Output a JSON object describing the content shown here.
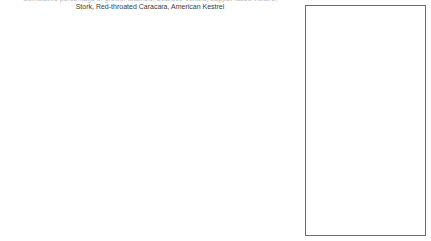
{
  "title": {
    "line1_clipped": "Cumulative percentage of growth attained, Bearded Vulture, Lappet-faced Vulture,",
    "line2": "Stork, Red-throated Caracara, American Kestrel"
  },
  "axes": {
    "y_ticks": [
      "0%",
      "10%",
      "20%",
      "30%",
      "40%",
      "50%",
      "60%",
      "70%",
      "80%",
      "90%",
      "100%"
    ],
    "y_min": 0,
    "y_max": 100,
    "x_ticks": [
      "62.5",
      "65",
      "67.5",
      "70",
      "72.5",
      "75",
      "77.5",
      "80",
      "82.5",
      "85",
      "87.5",
      "90",
      "92.5",
      "95"
    ],
    "x_min": 60,
    "x_max": 96.25,
    "x_label": "",
    "y_label": ""
  },
  "legend": {
    "items": [
      {
        "label": "Gypaetus barbatus",
        "marker": "filled-square"
      },
      {
        "label": "Torgos tracheliotus",
        "marker": "open-square"
      },
      {
        "label": "Sarcogyps calvus",
        "marker": "filled-diamond"
      },
      {
        "label": "Spilornis cheela",
        "marker": "open-diamond"
      },
      {
        "label": "Buteo buteo",
        "marker": "filled-triangle"
      },
      {
        "label": "Vultur gryphus",
        "marker": "open-triangle"
      },
      {
        "label": "Sarcoramphus papa",
        "marker": "cross-x"
      },
      {
        "label": "Mycteria ibis",
        "marker": "asterisk"
      },
      {
        "label": "Sagittarius serpentarius",
        "marker": "short-dash"
      },
      {
        "label": "Leptoptilos crumeniferus",
        "marker": "bold-dash"
      },
      {
        "label": "Daptrius americanus",
        "marker": "filled-square"
      },
      {
        "label": "Falco sparverius",
        "marker": "open-square"
      }
    ]
  },
  "chart_data": {
    "type": "line",
    "title": "Cumulative percentage of growth attained",
    "xlabel": "",
    "ylabel": "",
    "xlim": [
      60,
      96.25
    ],
    "ylim": [
      0,
      100
    ],
    "grid": false,
    "legend_position": "right",
    "x": [
      60,
      62.5,
      65,
      67.5,
      70,
      72.5,
      75,
      77.5,
      80,
      82.5,
      85,
      87.5,
      90,
      92.5,
      95
    ],
    "series": [
      {
        "name": "Torgos tracheliotus",
        "marker": "open-square",
        "values": [
          40,
          47,
          56,
          66,
          76,
          84,
          90,
          95,
          97,
          99,
          100,
          100,
          100,
          100,
          100
        ]
      },
      {
        "name": "Gypaetus barbatus",
        "marker": "filled-square",
        "values": [
          30,
          37,
          45,
          54,
          64,
          73,
          81,
          88,
          93,
          96,
          98,
          100,
          100,
          100,
          100
        ]
      },
      {
        "name": "Leptoptilos crumeniferus",
        "marker": "bold-dash",
        "values": [
          27,
          33,
          41,
          50,
          60,
          70,
          79,
          87,
          92,
          96,
          98,
          100,
          100,
          100,
          100
        ]
      },
      {
        "name": "Sagittarius serpentarius",
        "marker": "short-dash",
        "values": [
          26,
          32,
          39,
          48,
          58,
          68,
          78,
          86,
          92,
          96,
          98,
          100,
          100,
          100,
          100
        ]
      },
      {
        "name": "Sarcoramphus papa",
        "marker": "cross-x",
        "values": [
          24,
          30,
          37,
          46,
          56,
          66,
          76,
          85,
          91,
          95,
          98,
          100,
          100,
          100,
          100
        ]
      },
      {
        "name": "Mycteria ibis",
        "marker": "asterisk",
        "values": [
          23,
          29,
          36,
          44,
          54,
          64,
          74,
          83,
          90,
          95,
          98,
          99,
          100,
          100,
          100
        ]
      },
      {
        "name": "Spilornis cheela",
        "marker": "open-diamond",
        "values": [
          21,
          26,
          33,
          41,
          51,
          61,
          72,
          81,
          89,
          94,
          97,
          99,
          100,
          100,
          100
        ]
      },
      {
        "name": "Vultur gryphus",
        "marker": "open-triangle",
        "values": [
          19,
          24,
          30,
          38,
          47,
          58,
          69,
          79,
          87,
          93,
          97,
          99,
          100,
          100,
          100
        ]
      },
      {
        "name": "Buteo buteo",
        "marker": "filled-triangle",
        "values": [
          17,
          22,
          28,
          35,
          44,
          55,
          66,
          77,
          85,
          92,
          96,
          99,
          100,
          100,
          100
        ]
      },
      {
        "name": "Sarcogyps calvus",
        "marker": "filled-diamond",
        "values": [
          14,
          18,
          24,
          31,
          40,
          50,
          61,
          72,
          82,
          89,
          95,
          98,
          100,
          100,
          100
        ]
      },
      {
        "name": "Falco sparverius",
        "marker": "open-square",
        "values": [
          8,
          12,
          17,
          23,
          31,
          40,
          51,
          62,
          73,
          83,
          90,
          96,
          99,
          100,
          100
        ]
      },
      {
        "name": "Daptrius americanus",
        "marker": "filled-square",
        "values": [
          2,
          5,
          9,
          14,
          20,
          28,
          37,
          47,
          58,
          70,
          80,
          89,
          95,
          99,
          100
        ]
      }
    ]
  }
}
